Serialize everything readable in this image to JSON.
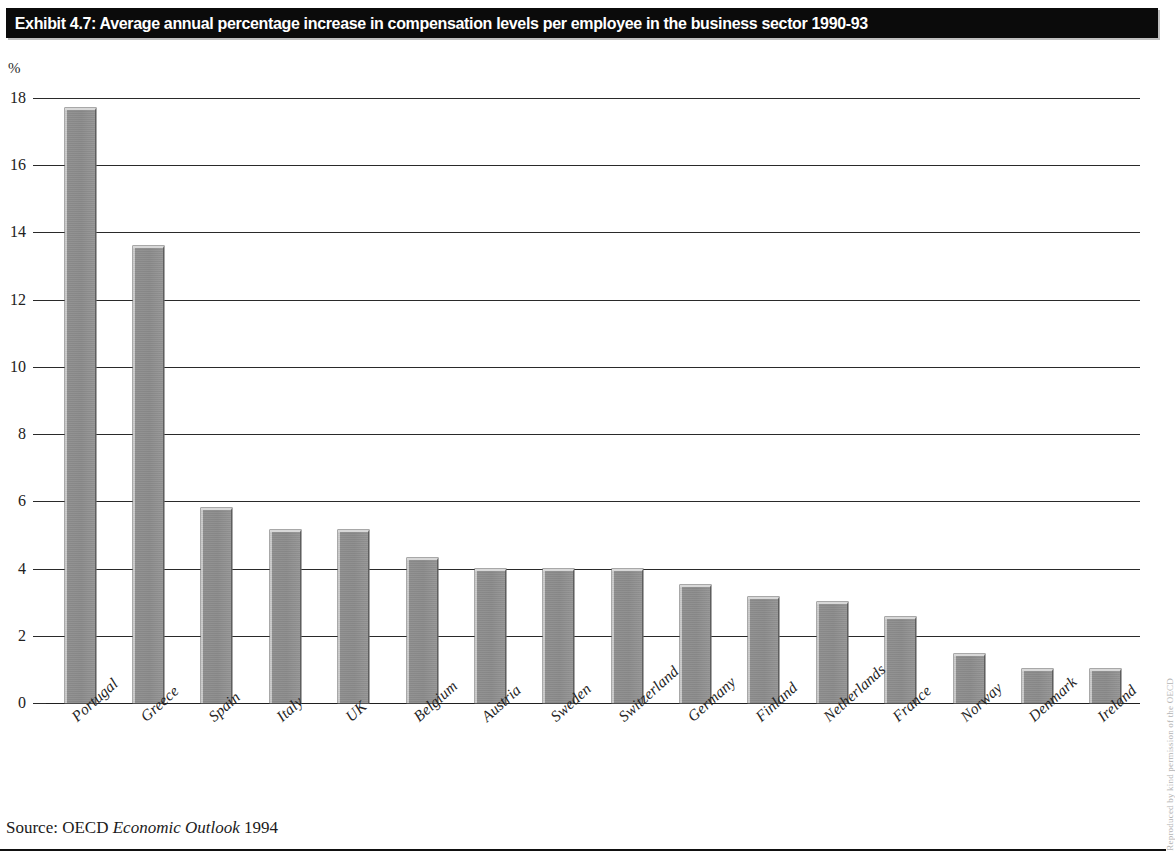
{
  "exhibit": {
    "title": "Exhibit 4.7: Average annual percentage increase in compensation levels per employee in the business sector 1990-93"
  },
  "source": {
    "prefix": "Source: OECD",
    "publication": "Economic Outlook",
    "year": "1994"
  },
  "edge_credit": "Reproduced by kind permission of the OECD",
  "axis": {
    "unit_label": "%"
  },
  "chart_data": {
    "type": "bar",
    "title": "Exhibit 4.7: Average annual percentage increase in compensation levels per employee in the business sector 1990-93",
    "xlabel": "",
    "ylabel": "%",
    "ylim": [
      0,
      18
    ],
    "ytick_values": [
      0,
      2,
      4,
      6,
      8,
      10,
      12,
      14,
      16,
      18
    ],
    "ytick_labels": [
      "0",
      "2",
      "4",
      "6",
      "8",
      "10",
      "12",
      "14",
      "16",
      "18"
    ],
    "grid": true,
    "legend": "none",
    "bar_color": "#8a8a8a",
    "categories": [
      "Portugal",
      "Greece",
      "Spain",
      "Italy",
      "UK",
      "Belgium",
      "Austria",
      "Sweden",
      "Switzerland",
      "Germany",
      "Finland",
      "Netherlands",
      "France",
      "Norway",
      "Denmark",
      "Ireland"
    ],
    "values": [
      17.7,
      13.6,
      5.8,
      5.15,
      5.15,
      4.3,
      4.0,
      4.0,
      4.0,
      3.5,
      3.15,
      3.0,
      2.55,
      1.45,
      1.0,
      1.0
    ]
  }
}
